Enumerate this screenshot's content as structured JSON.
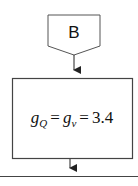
{
  "diagram": {
    "type": "flowchart-fragment",
    "connector": {
      "shape": "off-page-connector",
      "label": "B"
    },
    "process_box": {
      "formula": {
        "lhs_var": "g",
        "lhs_sub": "Q",
        "eq1": "=",
        "mid_var": "g",
        "mid_sub": "v",
        "eq2": "=",
        "value": "3.4"
      }
    },
    "edges": [
      {
        "from": "connector-B",
        "to": "process-box",
        "arrow": true
      },
      {
        "from": "process-box",
        "to": "next-step-line",
        "arrow": true
      }
    ],
    "colors": {
      "stroke": "#333333",
      "background": "#ffffff"
    }
  }
}
